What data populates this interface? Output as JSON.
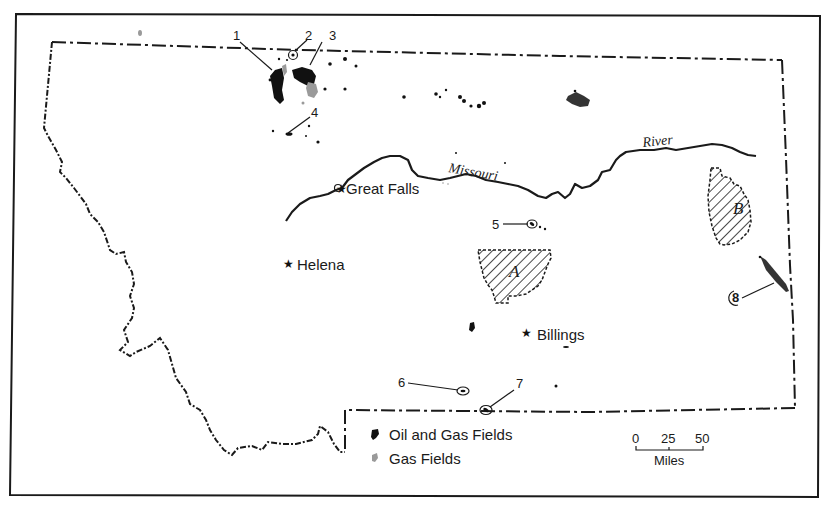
{
  "map": {
    "state": "Montana",
    "river": {
      "name_part1": "Missouri",
      "name_part2": "River"
    },
    "cities": [
      {
        "name": "Great Falls",
        "symbol": "★"
      },
      {
        "name": "Helena",
        "symbol": "★"
      },
      {
        "name": "Billings",
        "symbol": "★"
      }
    ],
    "field_labels": [
      "1",
      "2",
      "3",
      "4",
      "5",
      "6",
      "7",
      "8"
    ],
    "areas": [
      {
        "label": "A"
      },
      {
        "label": "B"
      }
    ],
    "legend": {
      "items": [
        {
          "label": "Oil and Gas Fields",
          "icon": "oil-gas-field-icon",
          "color": "#111111"
        },
        {
          "label": "Gas Fields",
          "icon": "gas-field-icon",
          "color": "#9a9a9a"
        }
      ]
    },
    "scale_bar": {
      "ticks": [
        "0",
        "25",
        "50"
      ],
      "unit": "Miles"
    }
  }
}
